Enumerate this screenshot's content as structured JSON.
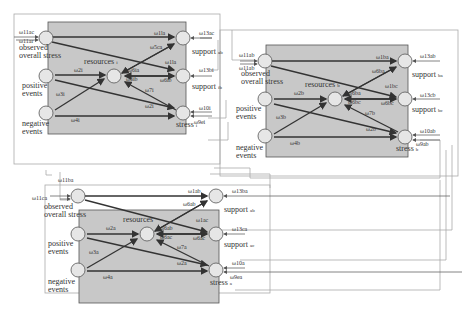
{
  "colors": {
    "panel": "#c8c8c8",
    "node": "#e6e6e6",
    "edge": "#333333",
    "frame": "#999999"
  },
  "models": [
    {
      "id": "A",
      "nodes": {
        "oos": "observed\noverall stress",
        "pos": "positive\nevents",
        "neg": "negative\nevents",
        "res": "resources",
        "res_sub": "i",
        "s1": "support",
        "s1_sub": "ab",
        "s2": "support",
        "s2_sub": "ib",
        "st": "stress",
        "st_sub": "i"
      },
      "weights": {
        "in1": "ω11ac",
        "in2": "ω11ar",
        "oos_s1": "ω1la",
        "oos_res": "ω5ca",
        "oos_s2": "ω1la",
        "pos_res": "ω2i",
        "neg_res": "ω3i",
        "neg_st": "ω4i",
        "pos_st": "ω2i",
        "res_a": "ω6ia",
        "res_b": "ω6ib",
        "s2_res": "ω6ib",
        "st_res": "ω7i",
        "s1_in": "ω13ac",
        "s2_in": "ω13bi",
        "st_in1": "ω10i",
        "st_in2": "ω9ei"
      }
    },
    {
      "id": "B",
      "nodes": {
        "oos": "observed\noverall stress",
        "pos": "positive\nevents",
        "neg": "negative\nevents",
        "res": "resources",
        "res_sub": "b",
        "s1": "support",
        "s1_sub": "ba",
        "s2": "support",
        "s2_sub": "bc",
        "st": "stress",
        "st_sub": "b"
      },
      "weights": {
        "in1": "ω11ab",
        "in2": "ω11ab",
        "oos_s1": "ω1ba",
        "oos_res": "ω6ba",
        "oos_s2": "ω1bc",
        "pos_res": "ω2b",
        "neg_res": "ω3b",
        "neg_st": "ω4b",
        "pos_st": "ω2b",
        "res_a": "ω6ba",
        "res_b": "ω6bc",
        "s2_res": "ω6bc",
        "st_res": "ω7b",
        "s1_in": "ω13ab",
        "s2_in": "ω13cb",
        "st_in1": "ω10ab",
        "st_in2": "ω9ab"
      }
    },
    {
      "id": "C",
      "nodes": {
        "oos": "observed\noverall stress",
        "pos": "positive\nevents",
        "neg": "negative\nevents",
        "res": "resources",
        "res_sub": "",
        "s1": "support",
        "s1_sub": "ab",
        "s2": "support",
        "s2_sub": "ac",
        "st": "stress",
        "st_sub": "a"
      },
      "weights": {
        "in1": "ω11ca",
        "in2": "ω11ba",
        "oos_s1": "ω1ab",
        "oos_res": "ω6ab",
        "oos_s2": "ω1ac",
        "pos_res": "ω2a",
        "neg_res": "ω3a",
        "neg_st": "ω4a",
        "pos_st": "ω2a",
        "res_a": "ω6ab",
        "res_b": "ω6ac",
        "s2_res": "ω6ac",
        "st_res": "ω7a",
        "s1_in": "ω13ba",
        "s2_in": "ω13ca",
        "st_in1": "ω10a",
        "st_in2": "ω9ea"
      }
    }
  ]
}
